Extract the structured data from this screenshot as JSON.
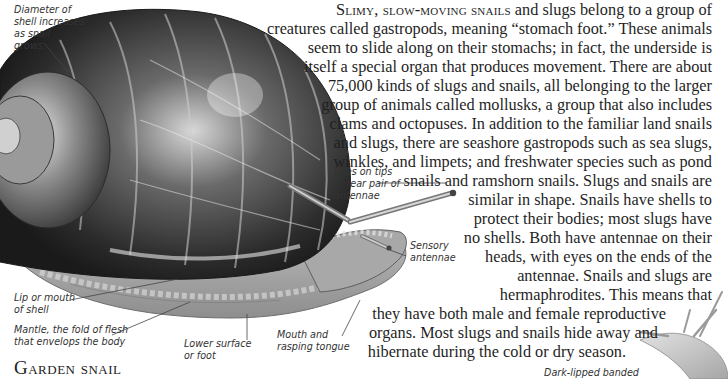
{
  "intro": {
    "lead_caps": "Slimy, slow-moving snails",
    "lines": [
      " and slugs belong to a group of",
      "creatures called gastropods, meaning “stomach foot.” These animals",
      "seem to slide along on their stomachs; in fact, the underside is",
      "itself a special organ that produces movement. There are about",
      "75,000 kinds of slugs and snails, all belonging to the larger",
      "group of animals called mollusks, a group that also includes",
      "clams and octopuses. In addition to the familiar land snails",
      "and slugs, there are seashore gastropods such as sea slugs,",
      "winkles, and limpets; and freshwater species such as pond",
      "snails and ramshorn snails. Slugs and snails are",
      "similar in shape. Snails have shells to",
      "protect their bodies; most slugs have",
      "no shells. Both have antennae on their",
      "heads, with eyes on the ends of the",
      "antennae. Snails and slugs are",
      "hermaphrodites. This means that",
      "they have both male and female reproductive",
      "organs. Most slugs and snails hide away and",
      "hibernate during the cold or dry season.",
      "During hibernation, snails seal the mouth",
      "of their shell with a film of dried mucus."
    ]
  },
  "labels": {
    "diameter": [
      "Diameter of",
      "shell increases",
      "as snail",
      "grows."
    ],
    "eyes": [
      "Eyes on tips",
      "of rear pair of",
      "antennae"
    ],
    "sensory": [
      "Sensory",
      "antennae"
    ],
    "lip": [
      "Lip or mouth",
      "of shell"
    ],
    "mantle": [
      "Mantle, the fold of flesh",
      "that envelops the body"
    ],
    "foot": [
      "Lower surface",
      "or foot"
    ],
    "mouth": [
      "Mouth and",
      "rasping tongue"
    ],
    "dark_lipped": "Dark-lipped banded"
  },
  "heading": "Garden snail"
}
